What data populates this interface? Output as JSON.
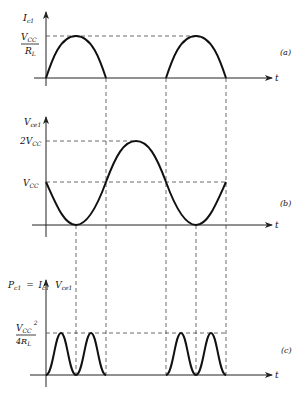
{
  "figure": {
    "panel_a": {
      "tag": "(a)",
      "y_label": "I",
      "y_label_sub": "c1",
      "level_label_num": "V",
      "level_label_num_sub": "CC",
      "level_label_den": "R",
      "level_label_den_sub": "L",
      "x_label": "t"
    },
    "panel_b": {
      "tag": "(b)",
      "y_label": "V",
      "y_label_sub": "ce1",
      "level_high": "2V",
      "level_high_sub": "CC",
      "level_mid": "V",
      "level_mid_sub": "CC",
      "x_label": "t"
    },
    "panel_c": {
      "tag": "(c)",
      "y_label_p": "P",
      "y_label_p_sub": "c1",
      "y_label_eq": "=",
      "y_label_i": "I",
      "y_label_i_sub": "c1",
      "y_label_v": "V",
      "y_label_v_sub": "ce1",
      "level_num": "V",
      "level_num_sub": "CC",
      "level_num_sup": "2",
      "level_den": "4R",
      "level_den_sub": "L",
      "x_label": "t"
    }
  }
}
